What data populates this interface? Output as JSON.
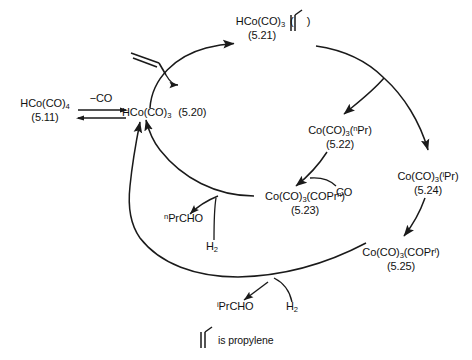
{
  "diagram": {
    "title_text": "Hydroformylation catalytic cycle",
    "legend": {
      "glyph_name": "propylene-glyph",
      "text": "is propylene"
    }
  },
  "species": {
    "hco_co4": {
      "formula_main": "HCo(CO)",
      "formula_sub": "4",
      "number": "(5.11)"
    },
    "hco_co3_left": {
      "formula_main": "HCo(CO)",
      "formula_sub": "3",
      "number": "(5.20)"
    },
    "hco_co3_propylene": {
      "formula_main": "HCo(CO)",
      "formula_sub": "3",
      "paren_open": "(",
      "paren_close": ")",
      "number": "(5.21)"
    },
    "co_co3_npr": {
      "prefix": "Co(CO)",
      "sub": "3",
      "ligand_sup": "n",
      "ligand": "Pr",
      "open": "(",
      "close": ")",
      "number": "(5.22)"
    },
    "co_co3_ipr": {
      "prefix": "Co(CO)",
      "sub": "3",
      "ligand_sup": "i",
      "ligand": "Pr",
      "open": "(",
      "close": ")",
      "number": "(5.24)"
    },
    "co_co3_coprn": {
      "prefix": "Co(CO)",
      "sub": "3",
      "acyl": "COPr",
      "acyl_sup": "n",
      "open": "(",
      "close": ")",
      "number": "(5.23)"
    },
    "co_co3_copri": {
      "prefix": "Co(CO)",
      "sub": "3",
      "acyl": "COPr",
      "acyl_sup": "i",
      "open": "(",
      "close": ")",
      "number": "(5.25)"
    }
  },
  "reagents": {
    "minus_co": "−CO",
    "co": "CO",
    "h2_main": "H",
    "h2_sub": "2",
    "npr_cho_sup": "n",
    "npr_cho": "PrCHO",
    "ipr_cho_sup": "i",
    "ipr_cho": "PrCHO"
  },
  "colors": {
    "stroke": "#1a1a1a",
    "text": "#111111",
    "background": "#ffffff"
  }
}
